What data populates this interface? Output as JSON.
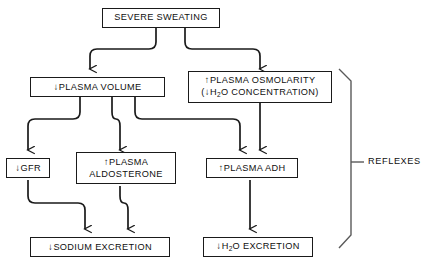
{
  "diagram": {
    "stroke_color": "#1a1a1a",
    "background_color": "#ffffff",
    "nodes": [
      {
        "id": "severe-sweating",
        "line1": "SEVERE SWEATING",
        "line2": "",
        "arrow": ""
      },
      {
        "id": "plasma-volume",
        "arrow": "↓",
        "line1": "PLASMA VOLUME",
        "line2": ""
      },
      {
        "id": "plasma-osmolarity",
        "arrow": "↑",
        "line1": "PLASMA OSMOLARITY",
        "line2_prefix": "(",
        "line2_arrow": "↓",
        "line2_h": "H",
        "line2_sub": "2",
        "line2_suffix": "O CONCENTRATION)"
      },
      {
        "id": "gfr",
        "arrow": "↓",
        "line1": "GFR",
        "line2": ""
      },
      {
        "id": "plasma-aldosterone",
        "arrow": "↑",
        "line1": "PLASMA",
        "line2": "ALDOSTERONE"
      },
      {
        "id": "plasma-adh",
        "arrow": "↑",
        "line1": "PLASMA ADH",
        "line2": ""
      },
      {
        "id": "sodium-excretion",
        "arrow": "↓",
        "line1": "SODIUM EXCRETION",
        "line2": ""
      },
      {
        "id": "water-excretion",
        "arrow": "↓",
        "line1_h": "H",
        "line1_sub": "2",
        "line1_suffix": "O EXCRETION"
      }
    ],
    "bracket": {
      "label": "REFLEXES"
    }
  }
}
